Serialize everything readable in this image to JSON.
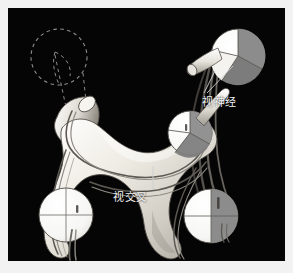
{
  "figure": {
    "background_color": "#050505",
    "frame_color": "#f2f2f2",
    "body_color": "#e9e6de",
    "tract_line_color": "#6e6e6e",
    "field_white_color": "#fbfbfb",
    "field_gray_color": "#8f8f8f",
    "label_color": "#f4f4f4",
    "dashed_color": "#9a9a9a",
    "leader_color": "#cfcfcf"
  },
  "labels": {
    "optic_nerve": "视神经",
    "optic_chiasm": "视交叉"
  },
  "visual_fields": [
    {
      "name": "upper-right-eye",
      "position": "top-right",
      "quadrants": [
        "white",
        "gray",
        "gray",
        "white"
      ]
    },
    {
      "name": "inner-right-eye",
      "position": "mid-right",
      "quadrants": [
        "white",
        "gray",
        "gray",
        "white"
      ]
    },
    {
      "name": "lower-left-eye",
      "position": "bottom-left",
      "quadrants": [
        "white",
        "white",
        "white",
        "white"
      ]
    },
    {
      "name": "lower-right-eye",
      "position": "bottom-right",
      "quadrants": [
        "white",
        "gray",
        "white",
        "gray"
      ]
    }
  ],
  "ghost_outline": {
    "name": "missing-eye-outline",
    "style": "dashed-circle"
  }
}
